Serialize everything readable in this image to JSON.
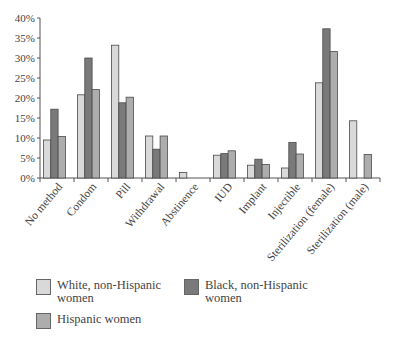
{
  "chart_data": {
    "type": "bar",
    "title": "",
    "xlabel": "",
    "ylabel": "",
    "ylim": [
      0,
      40
    ],
    "yticks": [
      "0%",
      "5%",
      "10%",
      "15%",
      "20%",
      "25%",
      "30%",
      "35%",
      "40%"
    ],
    "grid": false,
    "legend_position": "bottom",
    "categories": [
      "No method",
      "Condom",
      "Pill",
      "Withdrawal",
      "Abstinence",
      "IUD",
      "Implant",
      "Injectible",
      "Sterilization (female)",
      "Sterilization (male)"
    ],
    "series": [
      {
        "name": "White, non-Hispanic women",
        "color": "#d9d9d9",
        "values": [
          9.5,
          20.8,
          33.2,
          10.5,
          1.4,
          5.7,
          3.2,
          2.5,
          23.8,
          14.3
        ]
      },
      {
        "name": "Black, non-Hispanic women",
        "color": "#7a7a7a",
        "values": [
          17.2,
          30.0,
          18.8,
          7.2,
          0,
          6.1,
          4.7,
          8.9,
          37.3,
          0
        ]
      },
      {
        "name": "Hispanic women",
        "color": "#adadad",
        "values": [
          10.4,
          22.1,
          20.2,
          10.5,
          0,
          6.8,
          3.4,
          6.0,
          31.6,
          5.9
        ]
      }
    ]
  },
  "legend": {
    "white": "White, non-Hispanic women",
    "black": "Black, non-Hispanic women",
    "hispanic": "Hispanic women"
  }
}
